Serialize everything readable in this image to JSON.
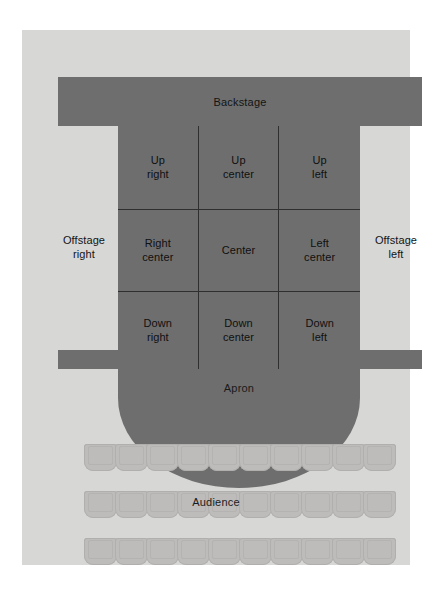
{
  "diagram": {
    "colors": {
      "page_background": "#ffffff",
      "panel_background": "#d7d7d5",
      "stage_fill": "#6e6e6e",
      "grid_line": "#2f2f2f",
      "seat_fill": "#bdbcba",
      "text": "#101010"
    },
    "backstage": {
      "label": "Backstage"
    },
    "apron": {
      "label": "Apron"
    },
    "offstage": {
      "right": "Offstage\nright",
      "right_line1": "Offstage",
      "right_line2": "right",
      "left_line1": "Offstage",
      "left_line2": "left"
    },
    "stage_grid": {
      "rows": [
        {
          "row": "up",
          "cells": [
            {
              "line1": "Up",
              "line2": "right"
            },
            {
              "line1": "Up",
              "line2": "center"
            },
            {
              "line1": "Up",
              "line2": "left"
            }
          ]
        },
        {
          "row": "center",
          "cells": [
            {
              "line1": "Right",
              "line2": "center"
            },
            {
              "line1": "Center",
              "line2": ""
            },
            {
              "line1": "Left",
              "line2": "center"
            }
          ]
        },
        {
          "row": "down",
          "cells": [
            {
              "line1": "Down",
              "line2": "right"
            },
            {
              "line1": "Down",
              "line2": "center"
            },
            {
              "line1": "Down",
              "line2": "left"
            }
          ]
        }
      ]
    },
    "audience": {
      "label": "Audience",
      "row_count": 3,
      "seats_per_row": 10
    }
  }
}
